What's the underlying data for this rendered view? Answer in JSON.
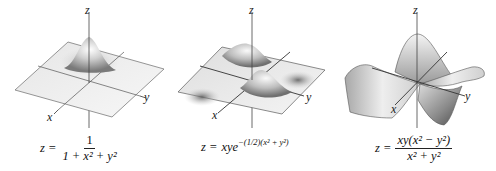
{
  "figures": [
    {
      "id": "surface-1",
      "axes": {
        "z": "z",
        "y": "y",
        "x": "x"
      },
      "formula": {
        "lhs": "z =",
        "numerator": "1",
        "denominator": "1 + x² + y²"
      },
      "description": "Single central peak on a flat plane"
    },
    {
      "id": "surface-2",
      "axes": {
        "z": "z",
        "y": "y",
        "x": "x"
      },
      "formula": {
        "lhs": "z =",
        "base": "xye",
        "exponent": "−(1/2)(x² + y²)"
      },
      "description": "Two peaks and two valleys on a plane"
    },
    {
      "id": "surface-3",
      "axes": {
        "z": "z",
        "y": "y",
        "x": "x"
      },
      "formula": {
        "lhs": "z =",
        "numerator": "xy(x² − y²)",
        "denominator": "x² + y²"
      },
      "description": "Monkey-saddle-like surface"
    }
  ],
  "colors": {
    "surface_light": "#f2f2f2",
    "surface_mid": "#c8c8c8",
    "surface_dark": "#6a6a6a",
    "axis": "#333333",
    "edge": "#555555"
  }
}
